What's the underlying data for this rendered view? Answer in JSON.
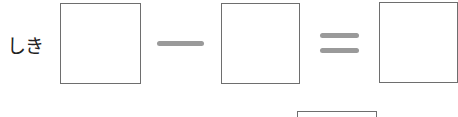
{
  "equation": {
    "label": "しき",
    "operator_minus": "−",
    "operator_equals": "=",
    "boxes": [
      "",
      "",
      "",
      ""
    ]
  },
  "colors": {
    "box_border": "#6e6e6e",
    "operator": "#9a9a9a",
    "text": "#222222"
  }
}
